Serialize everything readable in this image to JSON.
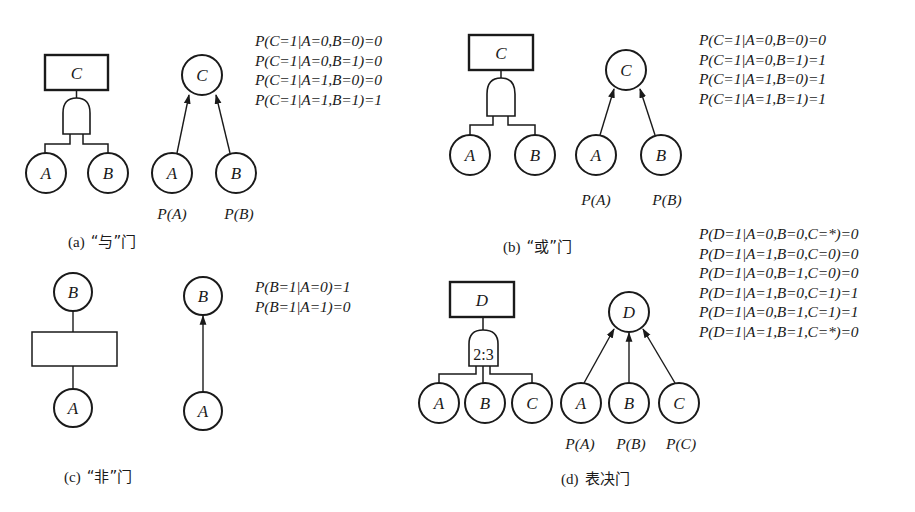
{
  "panels": {
    "a": {
      "caption_prefix": "(a)",
      "caption_label": "“与”门",
      "gate_type": "and",
      "fault_tree": {
        "top": "C",
        "inputs": [
          "A",
          "B"
        ]
      },
      "bayes_net": {
        "child": "C",
        "parents": [
          "A",
          "B"
        ],
        "priors": [
          "P(A)",
          "P(B)"
        ]
      },
      "equations": [
        "P(C=1|A=0,B=0)=0",
        "P(C=1|A=0,B=1)=0",
        "P(C=1|A=1,B=0)=0",
        "P(C=1|A=1,B=1)=1"
      ]
    },
    "b": {
      "caption_prefix": "(b)",
      "caption_label": "“或”门",
      "gate_type": "or",
      "fault_tree": {
        "top": "C",
        "inputs": [
          "A",
          "B"
        ]
      },
      "bayes_net": {
        "child": "C",
        "parents": [
          "A",
          "B"
        ],
        "priors": [
          "P(A)",
          "P(B)"
        ]
      },
      "equations": [
        "P(C=1|A=0,B=0)=0",
        "P(C=1|A=0,B=1)=1",
        "P(C=1|A=1,B=0)=1",
        "P(C=1|A=1,B=1)=1"
      ]
    },
    "c": {
      "caption_prefix": "(c)",
      "caption_label": "“非”门",
      "gate_type": "not",
      "fault_tree": {
        "top": "B",
        "inputs": [
          "A"
        ]
      },
      "bayes_net": {
        "child": "B",
        "parents": [
          "A"
        ]
      },
      "equations": [
        "P(B=1|A=0)=1",
        "P(B=1|A=1)=0"
      ]
    },
    "d": {
      "caption_prefix": "(d)",
      "caption_label": "表决门",
      "gate_type": "voting",
      "gate_label": "2:3",
      "fault_tree": {
        "top": "D",
        "inputs": [
          "A",
          "B",
          "C"
        ]
      },
      "bayes_net": {
        "child": "D",
        "parents": [
          "A",
          "B",
          "C"
        ],
        "priors": [
          "P(A)",
          "P(B)",
          "P(C)"
        ]
      },
      "equations": [
        "P(D=1|A=0,B=0,C=*)=0",
        "P(D=1|A=1,B=0,C=0)=0",
        "P(D=1|A=0,B=1,C=0)=0",
        "P(D=1|A=1,B=0,C=1)=1",
        "P(D=1|A=0,B=1,C=1)=1",
        "P(D=1|A=1,B=1,C=*)=0"
      ]
    }
  },
  "colors": {
    "stroke": "#1a1a1a",
    "background": "#ffffff"
  }
}
